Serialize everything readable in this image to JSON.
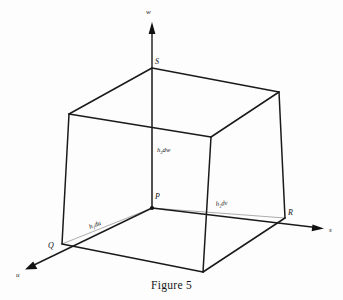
{
  "figure": {
    "caption": "Figure 5",
    "caption_x": 171,
    "caption_y": 279
  },
  "axes": [
    {
      "id": "w",
      "label": "w",
      "label_x": 148,
      "label_y": 13,
      "from": [
        152,
        208
      ],
      "to": [
        152,
        28
      ],
      "arrow": "up"
    },
    {
      "id": "s",
      "label": "s",
      "label_x": 330,
      "label_y": 232,
      "from": [
        152,
        208
      ],
      "to": [
        322,
        228
      ],
      "arrow": "right"
    },
    {
      "id": "u",
      "label": "u",
      "label_x": 18,
      "label_y": 276,
      "from": [
        152,
        208
      ],
      "to": [
        26,
        268
      ],
      "arrow": "left-down"
    }
  ],
  "points": [
    {
      "id": "P",
      "label": "P",
      "x": 152,
      "y": 208,
      "label_x": 155,
      "label_y": 199,
      "dot": true
    },
    {
      "id": "S",
      "label": "S",
      "x": 152,
      "y": 68,
      "label_x": 155,
      "label_y": 64,
      "dot": false
    },
    {
      "id": "Q",
      "label": "Q",
      "x": 62,
      "y": 244,
      "label_x": 50,
      "label_y": 247,
      "dot": false
    },
    {
      "id": "R",
      "label": "R",
      "x": 285,
      "y": 218,
      "label_x": 288,
      "label_y": 215,
      "dot": false
    }
  ],
  "element_labels": [
    {
      "id": "h3dw",
      "base": "h",
      "sub": "3",
      "rest": "dw",
      "x": 157,
      "y": 152,
      "rotate": 0
    },
    {
      "id": "h2dv",
      "base": "h",
      "sub": "2",
      "rest": "dv",
      "x": 216,
      "y": 206,
      "rotate": -6
    },
    {
      "id": "h1du",
      "base": "h",
      "sub": "1",
      "rest": "du",
      "x": 90,
      "y": 229,
      "rotate": -22
    }
  ],
  "element_edges": [
    {
      "id": "P-to-S",
      "from": [
        152,
        208
      ],
      "to": [
        152,
        68
      ]
    },
    {
      "id": "P-to-R",
      "from": [
        152,
        208
      ],
      "to": [
        285,
        218
      ]
    },
    {
      "id": "P-to-Q",
      "from": [
        152,
        208
      ],
      "to": [
        62,
        244
      ]
    }
  ],
  "cube": {
    "vertices": {
      "top_back_left": [
        69,
        114
      ],
      "top_front_top": [
        152,
        68
      ],
      "top_back_right": [
        279,
        92
      ],
      "top_front_right": [
        211,
        137
      ],
      "bottom_back_left": [
        62,
        244
      ],
      "bottom_front": [
        203,
        272
      ],
      "bottom_back_right": [
        285,
        218
      ],
      "bottom_front_right": [
        211,
        137
      ]
    },
    "edges": [
      {
        "id": "top-left-rear",
        "from": [
          69,
          114
        ],
        "to": [
          152,
          68
        ]
      },
      {
        "id": "top-rear-right",
        "from": [
          152,
          68
        ],
        "to": [
          279,
          92
        ]
      },
      {
        "id": "top-front-left",
        "from": [
          69,
          114
        ],
        "to": [
          211,
          137
        ]
      },
      {
        "id": "top-front-right",
        "from": [
          211,
          137
        ],
        "to": [
          279,
          92
        ]
      },
      {
        "id": "vert-left",
        "from": [
          69,
          114
        ],
        "to": [
          62,
          244
        ]
      },
      {
        "id": "vert-mid",
        "from": [
          211,
          137
        ],
        "to": [
          203,
          272
        ]
      },
      {
        "id": "vert-right",
        "from": [
          279,
          92
        ],
        "to": [
          285,
          218
        ]
      },
      {
        "id": "bottom-left",
        "from": [
          62,
          244
        ],
        "to": [
          203,
          272
        ]
      },
      {
        "id": "bottom-right",
        "from": [
          203,
          272
        ],
        "to": [
          285,
          218
        ]
      }
    ]
  },
  "colors": {
    "stroke": "#1a1a1a",
    "thin_stroke": "#8a8a8a",
    "background": "#fdfdfd",
    "text": "#111111"
  }
}
